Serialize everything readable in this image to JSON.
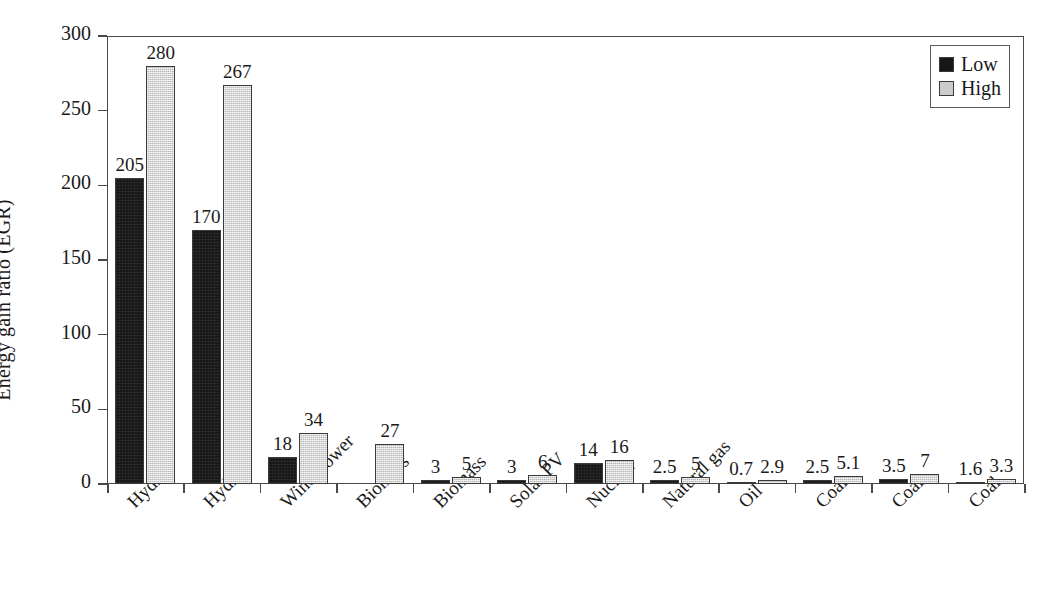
{
  "chart_data": {
    "type": "bar",
    "title": "",
    "xlabel": "",
    "ylabel": "Energy gain ratio (EGR)",
    "ylim": [
      0,
      300
    ],
    "yticks": [
      0,
      50,
      100,
      150,
      200,
      250,
      300
    ],
    "ytick_labels": [
      "0",
      "50",
      "100",
      "150",
      "200",
      "250",
      "300"
    ],
    "grid": false,
    "legend_position": "top-right",
    "categories": [
      "Hydro",
      "Hydro",
      "Wind Power",
      "Biomass",
      "Biomass",
      "Solar PV",
      "Nuclear",
      "Natural gas",
      "Oil",
      "Coal",
      "Coal",
      "Coal"
    ],
    "series": [
      {
        "name": "Low",
        "color": "#171717",
        "values": [
          205,
          170,
          18,
          null,
          3,
          3,
          14,
          2.5,
          0.7,
          2.5,
          3.5,
          1.6
        ],
        "labels": [
          "205",
          "170",
          "18",
          "",
          "3",
          "3",
          "14",
          "2.5",
          "0.7",
          "2.5",
          "3.5",
          "1.6"
        ]
      },
      {
        "name": "High",
        "color": "#cbcbcb",
        "values": [
          280,
          267,
          34,
          27,
          5,
          6,
          16,
          5,
          2.9,
          5.1,
          7,
          3.3
        ],
        "labels": [
          "280",
          "267",
          "34",
          "27",
          "5",
          "6",
          "16",
          "5",
          "2.9",
          "5.1",
          "7",
          "3.3"
        ]
      }
    ]
  },
  "legend": {
    "items": [
      {
        "label": "Low",
        "color": "#171717"
      },
      {
        "label": "High",
        "color": "#cbcbcb"
      }
    ]
  },
  "axes": {
    "y_title": "Energy gain ratio (EGR)"
  },
  "colors": {
    "low": "#171717",
    "high": "#cbcbcb",
    "axis": "#4a4a4a",
    "text": "#1a1a1a",
    "background": "#ffffff"
  }
}
